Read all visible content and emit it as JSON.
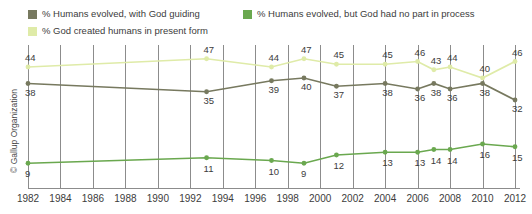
{
  "credit": "© Gallup Organization",
  "legend": {
    "position": "top-left",
    "items": [
      {
        "label": "% Humans evolved, with God guiding",
        "color": "#77795f",
        "series_key": "god_guiding"
      },
      {
        "label": "% Humans evolved, but God had no part in process",
        "color": "#6aa84f",
        "series_key": "no_god"
      },
      {
        "label": "% God created humans in present form",
        "color": "#dfeba8",
        "series_key": "created"
      }
    ]
  },
  "chart_data": {
    "type": "line",
    "title": "",
    "subtitle": "",
    "xlabel": "",
    "ylabel": "",
    "grid": "vertical",
    "xlim": [
      1982,
      2013
    ],
    "ylim": [
      0,
      52
    ],
    "xticks": [
      "1982",
      "1984",
      "1986",
      "1988",
      "1990",
      "1992",
      "1994",
      "1996",
      "1998",
      "2000",
      "2002",
      "2004",
      "2006",
      "2008",
      "2010",
      "2012"
    ],
    "series": [
      {
        "name": "% God created humans in present form",
        "color": "#dfeba8",
        "points": [
          {
            "x": 1982,
            "y": 44,
            "label": "44"
          },
          {
            "x": 1993,
            "y": 47,
            "label": "47"
          },
          {
            "x": 1997,
            "y": 44,
            "label": "44"
          },
          {
            "x": 1999,
            "y": 47,
            "label": "47"
          },
          {
            "x": 2001,
            "y": 45,
            "label": "45"
          },
          {
            "x": 2004,
            "y": 45,
            "label": "45"
          },
          {
            "x": 2006,
            "y": 46,
            "label": "46"
          },
          {
            "x": 2007,
            "y": 43,
            "label": "43"
          },
          {
            "x": 2008,
            "y": 44,
            "label": "44"
          },
          {
            "x": 2010,
            "y": 40,
            "label": "40"
          },
          {
            "x": 2012,
            "y": 46,
            "label": "46"
          }
        ]
      },
      {
        "name": "% Humans evolved, with God guiding",
        "color": "#77795f",
        "points": [
          {
            "x": 1982,
            "y": 38,
            "label": "38"
          },
          {
            "x": 1993,
            "y": 35,
            "label": "35"
          },
          {
            "x": 1997,
            "y": 39,
            "label": "39"
          },
          {
            "x": 1999,
            "y": 40,
            "label": "40"
          },
          {
            "x": 2001,
            "y": 37,
            "label": "37"
          },
          {
            "x": 2004,
            "y": 38,
            "label": "38"
          },
          {
            "x": 2006,
            "y": 36,
            "label": "36"
          },
          {
            "x": 2007,
            "y": 38,
            "label": "38"
          },
          {
            "x": 2008,
            "y": 36,
            "label": "36"
          },
          {
            "x": 2010,
            "y": 38,
            "label": "38"
          },
          {
            "x": 2012,
            "y": 32,
            "label": "32"
          }
        ]
      },
      {
        "name": "% Humans evolved, but God had no part in process",
        "color": "#6aa84f",
        "points": [
          {
            "x": 1982,
            "y": 9,
            "label": "9"
          },
          {
            "x": 1993,
            "y": 11,
            "label": "11"
          },
          {
            "x": 1997,
            "y": 10,
            "label": "10"
          },
          {
            "x": 1999,
            "y": 9,
            "label": "9"
          },
          {
            "x": 2001,
            "y": 12,
            "label": "12"
          },
          {
            "x": 2004,
            "y": 13,
            "label": "13"
          },
          {
            "x": 2006,
            "y": 13,
            "label": "13"
          },
          {
            "x": 2007,
            "y": 14,
            "label": "14"
          },
          {
            "x": 2008,
            "y": 14,
            "label": "14"
          },
          {
            "x": 2010,
            "y": 16,
            "label": "16"
          },
          {
            "x": 2012,
            "y": 15,
            "label": "15"
          }
        ]
      }
    ]
  }
}
